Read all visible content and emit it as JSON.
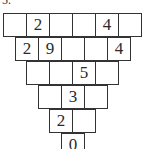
{
  "problem_label": "5.",
  "pyramid": {
    "rows": [
      [
        "",
        "2",
        "",
        "",
        "4",
        ""
      ],
      [
        "2",
        "9",
        "",
        "",
        "4"
      ],
      [
        "",
        "",
        "5",
        ""
      ],
      [
        "",
        "3",
        ""
      ],
      [
        "2",
        ""
      ],
      [
        "0"
      ]
    ]
  }
}
